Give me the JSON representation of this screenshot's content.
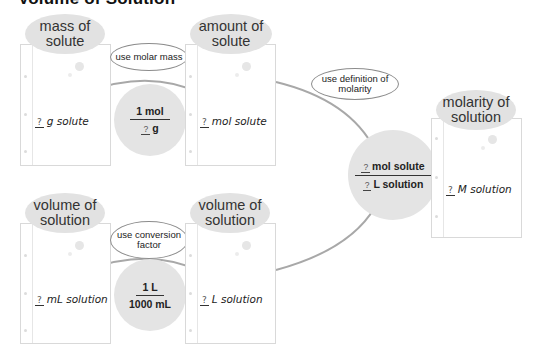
{
  "title": "Volume of Solution",
  "boxes": {
    "mass_of_solute": {
      "label": "mass of solute",
      "q": "?",
      "value": "g solute"
    },
    "amount_of_solute": {
      "label": "amount of solute",
      "q": "?",
      "value": "mol solute"
    },
    "molarity_of_solution": {
      "label": "molarity of solution",
      "q": "?",
      "value": "M solution"
    },
    "volume_ml": {
      "label": "volume of solution",
      "q": "?",
      "value": "mL solution"
    },
    "volume_l": {
      "label": "volume of solution",
      "q": "?",
      "value": "L solution"
    }
  },
  "hints": {
    "molar_mass": "use molar mass",
    "definition": "use definition of molarity",
    "conversion": "use conversion factor"
  },
  "factors": {
    "molar_mass": {
      "numerator": "1 mol",
      "q": "?",
      "denominator_unit": "g"
    },
    "conversion": {
      "numerator": "1 L",
      "denominator": "1000 mL"
    },
    "molarity": {
      "num_q": "?",
      "numerator_unit": "mol solute",
      "den_q": "?",
      "denominator_unit": "L solution"
    }
  },
  "colors": {
    "bubble_fill": "#e2e2e2",
    "arrow": "#9a9a9a",
    "page_border": "#d9d9d9"
  }
}
